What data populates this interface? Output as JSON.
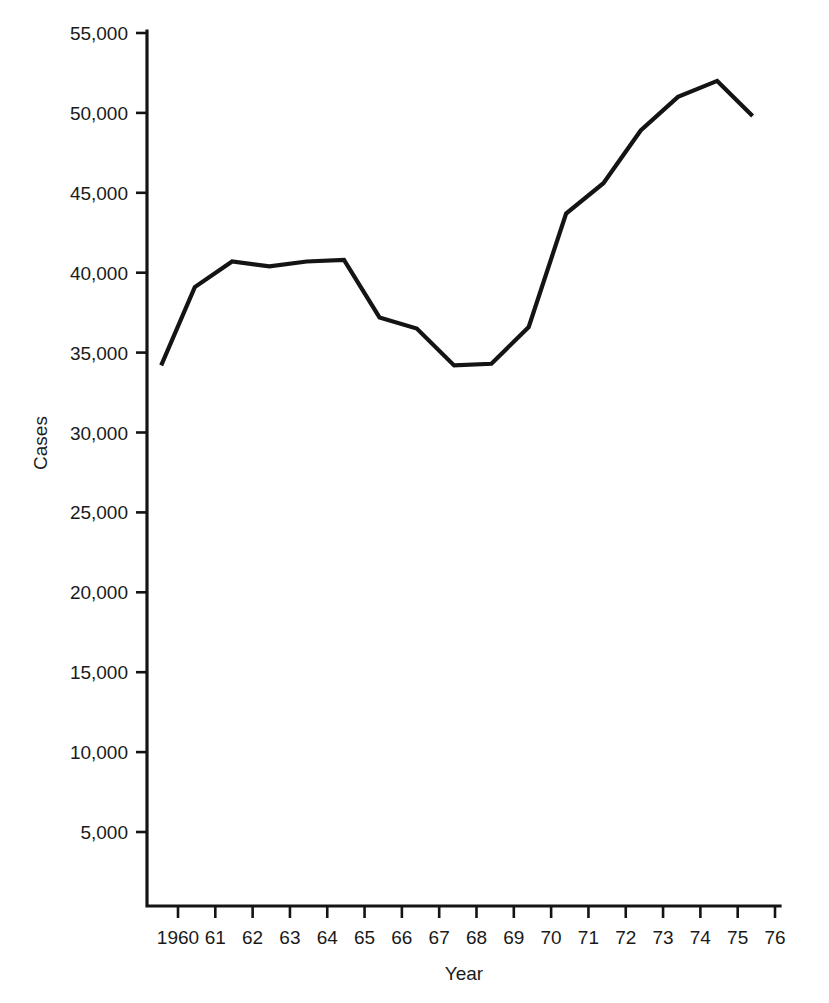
{
  "chart_data": {
    "type": "line",
    "title": "",
    "xlabel": "Year",
    "ylabel": "Cases",
    "grid": false,
    "legend": null,
    "legend_position": "none",
    "xlim": [
      1959.5,
      1976.0
    ],
    "ylim": [
      0,
      55000
    ],
    "x_tick_labels": [
      "1960",
      "61",
      "62",
      "63",
      "64",
      "65",
      "66",
      "67",
      "68",
      "69",
      "70",
      "71",
      "72",
      "73",
      "74",
      "75",
      "76"
    ],
    "x_tick_values": [
      1960,
      1961,
      1962,
      1963,
      1964,
      1965,
      1966,
      1967,
      1968,
      1969,
      1970,
      1971,
      1972,
      1973,
      1974,
      1975,
      1976
    ],
    "y_tick_labels": [
      "5,000",
      "10,000",
      "15,000",
      "20,000",
      "25,000",
      "30,000",
      "35,000",
      "40,000",
      "45,000",
      "50,000",
      "55,000"
    ],
    "y_tick_values": [
      5000,
      10000,
      15000,
      20000,
      25000,
      30000,
      35000,
      40000,
      45000,
      50000,
      55000
    ],
    "series": [
      {
        "name": "Cases",
        "color": "#141414",
        "x": [
          1959.55,
          1960.45,
          1961.45,
          1962.45,
          1963.45,
          1964.45,
          1965.4,
          1966.4,
          1967.4,
          1968.4,
          1969.4,
          1970.4,
          1971.4,
          1972.4,
          1973.4,
          1974.45,
          1975.4
        ],
        "values": [
          34200,
          39100,
          40700,
          40400,
          40700,
          40800,
          37200,
          36500,
          34200,
          34300,
          36600,
          43700,
          45600,
          48900,
          51000,
          52000,
          49800
        ]
      }
    ]
  },
  "axes": {
    "y_axis_title": "Cases",
    "x_axis_title": "Year"
  }
}
